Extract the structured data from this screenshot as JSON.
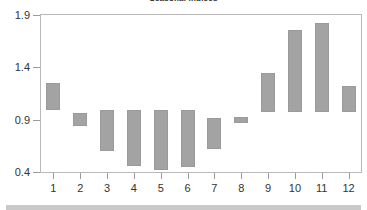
{
  "chart_data": {
    "type": "bar",
    "title": "Seasonal indices",
    "xlabel": "",
    "ylabel": "",
    "ylim": [
      0.4,
      1.9
    ],
    "yticks": [
      "0.4",
      "0.9",
      "1.4",
      "1.9"
    ],
    "ytick_values": [
      0.4,
      0.9,
      1.4,
      1.9
    ],
    "grid": false,
    "legend": false,
    "bar_style": "floating-range",
    "categories": [
      "1",
      "2",
      "3",
      "4",
      "5",
      "6",
      "7",
      "8",
      "9",
      "10",
      "11",
      "12"
    ],
    "series": [
      {
        "name": "range-high",
        "values": [
          1.25,
          0.96,
          0.99,
          0.99,
          0.99,
          0.99,
          0.92,
          0.93,
          1.35,
          1.76,
          1.82,
          1.22
        ]
      },
      {
        "name": "range-low",
        "values": [
          0.99,
          0.84,
          0.6,
          0.46,
          0.42,
          0.45,
          0.62,
          0.87,
          0.97,
          0.97,
          0.97,
          0.97
        ]
      }
    ],
    "colors": {
      "bar_fill": "#a3a3a3",
      "bar_edge": "#9a9a9a",
      "frame": "#b9b9b9",
      "text": "#333333",
      "background": "#ffffff"
    }
  }
}
